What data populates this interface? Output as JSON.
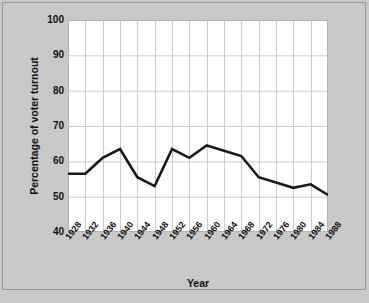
{
  "chart_data": {
    "type": "line",
    "title": "",
    "xlabel": "Year",
    "ylabel": "Percentage of voter turnout",
    "x": [
      1928,
      1932,
      1936,
      1940,
      1944,
      1948,
      1952,
      1956,
      1960,
      1964,
      1968,
      1972,
      1976,
      1980,
      1984,
      1988
    ],
    "categories": [
      "1928",
      "1932",
      "1936",
      "1940",
      "1944",
      "1948",
      "1952",
      "1956",
      "1960",
      "1964",
      "1968",
      "1972",
      "1976",
      "1980",
      "1984",
      "1988"
    ],
    "values": [
      56.5,
      56.5,
      61.0,
      63.5,
      55.5,
      53.0,
      63.5,
      61.0,
      64.5,
      63.0,
      61.5,
      55.5,
      54.0,
      52.5,
      53.5,
      50.5
    ],
    "series": [
      {
        "name": "Percentage of voter turnout",
        "values": [
          56.5,
          56.5,
          61.0,
          63.5,
          55.5,
          53.0,
          63.5,
          61.0,
          64.5,
          63.0,
          61.5,
          55.5,
          54.0,
          52.5,
          53.5,
          50.5
        ],
        "color": "#1a1a1a"
      }
    ],
    "xlim": [
      1928,
      1988
    ],
    "ylim": [
      40,
      100
    ],
    "yticks": [
      40,
      50,
      60,
      70,
      80,
      90,
      100
    ],
    "ytick_labels": [
      "40",
      "50",
      "60",
      "70",
      "80",
      "90",
      "100"
    ],
    "grid": true,
    "grid_color": "#cccccc",
    "legend": false,
    "legend_position": "none",
    "plot_background": "#ffffff",
    "figure_background": "#c8c8c8",
    "line_width": 2.6
  }
}
